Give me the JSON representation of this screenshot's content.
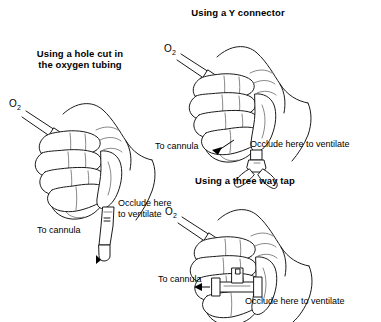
{
  "figure": {
    "caption_style": "medical line illustration",
    "ink_color": "#1a1a1a",
    "background_color": "#ffffff"
  },
  "panels": [
    {
      "id": "hole-in-tubing",
      "title": "Using a hole cut in\nthe oxygen tubing",
      "oxygen_label": "O",
      "oxygen_subscript": "2",
      "labels": {
        "occlude": "Occlude here\nto ventilate",
        "cannula": "To cannula"
      }
    },
    {
      "id": "y-connector",
      "title": "Using a Y connector",
      "oxygen_label": "O",
      "oxygen_subscript": "2",
      "labels": {
        "occlude": "Occlude here to ventilate",
        "cannula": "To cannula"
      }
    },
    {
      "id": "three-way-tap",
      "title": "Using a three way tap",
      "oxygen_label": "O",
      "oxygen_subscript": "2",
      "labels": {
        "occlude": "Occlude here to ventilate",
        "cannula": "To cannula"
      }
    }
  ]
}
